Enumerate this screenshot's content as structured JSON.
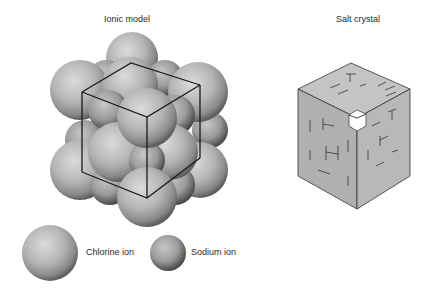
{
  "figure": {
    "left_panel": {
      "title": "Ionic model",
      "legend": [
        {
          "label": "Chlorine ion",
          "kind": "large-sphere"
        },
        {
          "label": "Sodium ion",
          "kind": "small-sphere"
        }
      ]
    },
    "right_panel": {
      "title": "Salt crystal"
    }
  },
  "colors": {
    "sphere_light": "#d8d8d8",
    "sphere_dark": "#6a6a6a",
    "cube_face": "#b8b8b8",
    "edge": "#1a1a1a"
  }
}
